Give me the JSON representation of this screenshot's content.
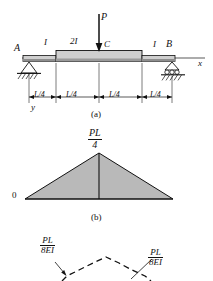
{
  "figure": {
    "panels": [
      {
        "id": "a",
        "caption": "(a)",
        "description": "simply supported beam with central point load"
      },
      {
        "id": "b",
        "caption": "(b)",
        "description": "bending moment diagram"
      },
      {
        "id": "c",
        "caption": "",
        "description": "M over EI diagram"
      }
    ]
  },
  "beam": {
    "load_label": "P",
    "point_a": "A",
    "point_b": "B",
    "point_c": "C",
    "section_left": "I",
    "section_middle": "2I",
    "section_right": "I",
    "axis_x": "x",
    "axis_y": "y",
    "dimensions": [
      "L/4",
      "L/4",
      "L/4",
      "L/4"
    ],
    "caption": "(a)"
  },
  "moment_diagram": {
    "peak_numerator": "PL",
    "peak_denominator": "4",
    "baseline_value": "0",
    "caption": "(b)"
  },
  "mei_diagram": {
    "left_numerator": "PL",
    "left_denominator": "8EI",
    "right_numerator": "PL",
    "right_denominator": "8EI"
  },
  "colors": {
    "line": "#111111",
    "fill": "#b9b9b9",
    "beam_fill": "#cccccc",
    "beam_dark": "#8a8a8a"
  }
}
